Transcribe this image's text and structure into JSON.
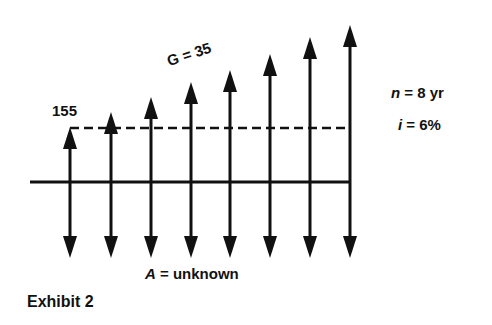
{
  "diagram": {
    "type": "cash-flow-diagram",
    "caption": "Exhibit 2",
    "first_payment_label": "155",
    "gradient_label": "G = 35",
    "period_symbol": "n",
    "period_value": "= 8 yr",
    "rate_symbol": "i",
    "rate_value": "= 6%",
    "annuity_symbol": "A",
    "annuity_value": "= unknown",
    "periods": 8,
    "up_arrows": [
      {
        "x": 70,
        "top": 127
      },
      {
        "x": 111,
        "top": 112
      },
      {
        "x": 151,
        "top": 97
      },
      {
        "x": 191,
        "top": 82
      },
      {
        "x": 230,
        "top": 70
      },
      {
        "x": 270,
        "top": 54
      },
      {
        "x": 310,
        "top": 37
      },
      {
        "x": 350,
        "top": 25
      }
    ],
    "down_arrow_tip": 258,
    "timeline": {
      "y": 182,
      "x1": 30,
      "x2": 350
    },
    "baseline_dashed_y": 128,
    "colors": {
      "ink": "#111111",
      "background": "#ffffff"
    }
  }
}
